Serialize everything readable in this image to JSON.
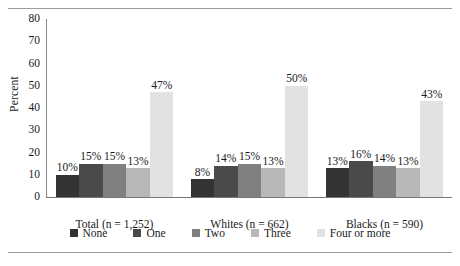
{
  "chart_data": {
    "type": "bar",
    "title": "",
    "xlabel": "",
    "ylabel": "Percent",
    "ylim": [
      0,
      80
    ],
    "yticks": [
      80,
      70,
      60,
      50,
      40,
      30,
      20,
      10,
      0
    ],
    "grid": false,
    "legend_position": "bottom",
    "categories": [
      "Total (n = 1,252)",
      "Whites (n = 662)",
      "Blacks (n = 590)"
    ],
    "series": [
      {
        "name": "None",
        "color": "#333333",
        "values": [
          10,
          8,
          13
        ],
        "labels": [
          "10%",
          "8%",
          "13%"
        ]
      },
      {
        "name": "One",
        "color": "#4a4a4a",
        "values": [
          15,
          14,
          16
        ],
        "labels": [
          "15%",
          "14%",
          "16%"
        ]
      },
      {
        "name": "Two",
        "color": "#808080",
        "values": [
          15,
          15,
          14
        ],
        "labels": [
          "15%",
          "15%",
          "14%"
        ]
      },
      {
        "name": "Three",
        "color": "#b8b8b8",
        "values": [
          13,
          13,
          13
        ],
        "labels": [
          "13%",
          "13%",
          "13%"
        ]
      },
      {
        "name": "Four or more",
        "color": "#e2e2e2",
        "values": [
          47,
          50,
          43
        ],
        "labels": [
          "47%",
          "50%",
          "43%"
        ]
      }
    ]
  }
}
